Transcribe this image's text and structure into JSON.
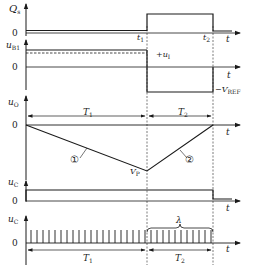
{
  "diagram": {
    "type": "timing-diagram",
    "colors": {
      "line": "#1a1a1a",
      "background": "#ffffff",
      "dash": "#444444"
    },
    "rows": [
      {
        "id": "qs",
        "ylabel": "Q",
        "ylabel_sub": "s",
        "zero": "0",
        "t_label": "t"
      },
      {
        "id": "ub1",
        "ylabel": "u",
        "ylabel_sub": "B1",
        "zero": "0",
        "t_label": "t",
        "plus_label": "+u",
        "plus_sub": "I",
        "minus_label": "−V",
        "minus_sub": "REF"
      },
      {
        "id": "uo",
        "ylabel": "u",
        "ylabel_sub": "O",
        "zero": "0",
        "t_label": "t",
        "vp_label": "V",
        "vp_sub": "P",
        "curve1": "①",
        "curve2": "②"
      },
      {
        "id": "uc1",
        "ylabel": "u",
        "ylabel_sub": "C",
        "zero": "0",
        "t_label": "t"
      },
      {
        "id": "uc2",
        "ylabel": "u",
        "ylabel_sub": "C",
        "zero": "0",
        "t_label": "t",
        "lambda": "λ"
      }
    ],
    "time_marks": {
      "t1": "t",
      "t1_sub": "1",
      "t2": "t",
      "t2_sub": "2"
    },
    "intervals": {
      "T1": "T",
      "T1_sub": "1",
      "T2": "T",
      "T2_sub": "2"
    }
  }
}
